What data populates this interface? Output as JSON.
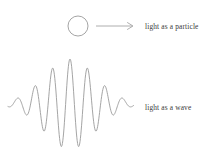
{
  "figure": {
    "background_color": "#ffffff",
    "stroke_color": "#9a9a9a",
    "text_color": "#3a3a3a"
  },
  "particle_row": {
    "shape_icon": "circle-outline-icon",
    "arrow_icon": "arrow-right-icon",
    "label": "light as a particle",
    "circle": {
      "cx": 78,
      "cy": 26,
      "r": 10
    },
    "arrow": {
      "x1": 96,
      "x2": 133,
      "y": 26
    }
  },
  "wave_row": {
    "wave_icon": "wave-packet-icon",
    "label": "light as a wave"
  },
  "chart_data": {
    "type": "line",
    "title": "",
    "xlabel": "",
    "ylabel": "",
    "grid": false,
    "legend": null,
    "xlim": [
      8,
      134
    ],
    "ylim": [
      58,
      150
    ],
    "baseline_y": 104,
    "envelope": {
      "type": "gaussian",
      "center_x": 70,
      "sigma": 26,
      "peak_amplitude": 45
    },
    "wave": {
      "wavelength_px": 17.5,
      "cycles": 7.2,
      "phase": 0
    },
    "series": [
      {
        "name": "wave packet",
        "x": [
          8,
          12,
          16,
          20,
          24,
          28,
          32,
          36,
          40,
          44,
          48,
          52,
          56,
          60,
          64,
          68,
          72,
          76,
          80,
          84,
          88,
          92,
          96,
          100,
          104,
          108,
          112,
          116,
          120,
          124,
          128,
          133
        ],
        "y": [
          104,
          99,
          94,
          97,
          104,
          112,
          115,
          110,
          99,
          86,
          78,
          84,
          100,
          118,
          130,
          120,
          96,
          70,
          60,
          72,
          98,
          126,
          142,
          128,
          100,
          78,
          72,
          84,
          103,
          118,
          112,
          100
        ]
      }
    ]
  }
}
